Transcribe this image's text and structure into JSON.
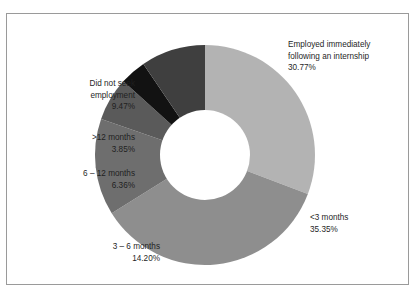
{
  "chart_data": {
    "type": "pie",
    "title": "",
    "subtitle": "",
    "xlabel": "",
    "ylabel": "",
    "donut": true,
    "legend_position": "around-slices",
    "grid": false,
    "categories": [
      "Employed immediately following an internship",
      "<3 months",
      "3 – 6 months",
      "6 – 12 months",
      ">12 months",
      "Did not seek employment"
    ],
    "values": [
      30.77,
      35.35,
      14.2,
      6.36,
      3.85,
      9.47
    ],
    "value_labels": [
      "30.77%",
      "35.35%",
      "14.20%",
      "6.36%",
      "3.85%",
      "9.47%"
    ],
    "colors": [
      "#b3b3b3",
      "#8e8e8e",
      "#6e6e6e",
      "#5a5a5a",
      "#121212",
      "#3f3f3f"
    ],
    "slices": [
      {
        "name": "employed-immediately",
        "label_lines": [
          "Employed immediately",
          "following an internship",
          "30.77%"
        ],
        "value": 30.77,
        "color": "#b3b3b3"
      },
      {
        "name": "lt-3-months",
        "label_lines": [
          "<3 months",
          "35.35%"
        ],
        "value": 35.35,
        "color": "#8e8e8e"
      },
      {
        "name": "3-6-months",
        "label_lines": [
          "3 – 6 months",
          "14.20%"
        ],
        "value": 14.2,
        "color": "#6e6e6e"
      },
      {
        "name": "6-12-months",
        "label_lines": [
          "6 – 12 months",
          "6.36%"
        ],
        "value": 6.36,
        "color": "#5a5a5a"
      },
      {
        "name": "gt-12-months",
        "label_lines": [
          ">12 months",
          "3.85%"
        ],
        "value": 3.85,
        "color": "#121212"
      },
      {
        "name": "did-not-seek-employment",
        "label_lines": [
          "Did not seek",
          "employment",
          "9.47%"
        ],
        "value": 9.47,
        "color": "#3f3f3f"
      }
    ]
  },
  "labels": {
    "employed_immediately": {
      "line1": "Employed immediately",
      "line2": "following an internship",
      "line3": "30.77%"
    },
    "did_not_seek": {
      "line1": "Did not seek",
      "line2": "employment",
      "line3": "9.47%"
    },
    "gt_12_months": {
      "line1": ">12 months",
      "line2": "3.85%"
    },
    "six_to_12_months": {
      "line1": "6 – 12 months",
      "line2": "6.36%"
    },
    "three_to_6_months": {
      "line1": "3 – 6 months",
      "line2": "14.20%"
    },
    "lt_3_months": {
      "line1": "<3 months",
      "line2": "35.35%"
    }
  },
  "title": {
    "text": ""
  }
}
